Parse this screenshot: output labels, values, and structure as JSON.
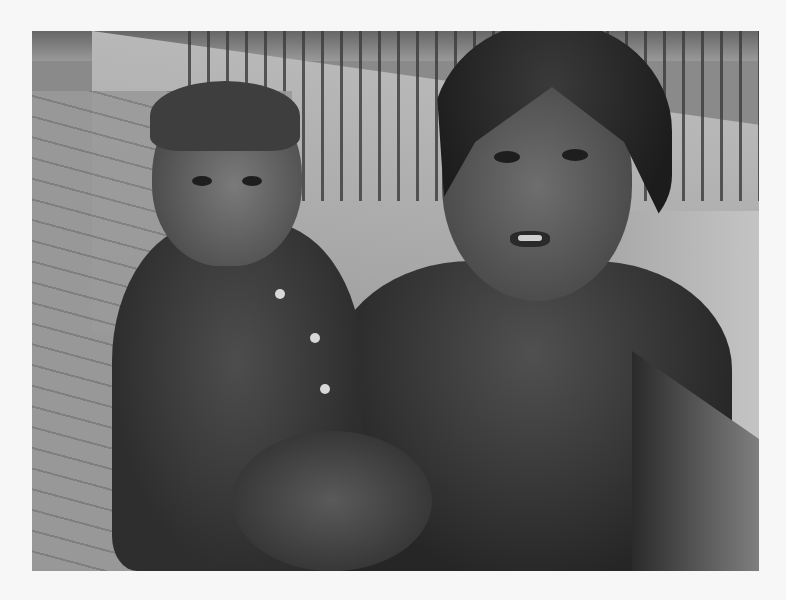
{
  "image": {
    "kind": "photograph",
    "color_mode": "grayscale",
    "frame": {
      "x": 32,
      "y": 31,
      "width": 727,
      "height": 540
    },
    "background_color": "#f7f7f7",
    "description": "Two children on a city pavement: an older girl wearing a dark knit cap and t-shirt holds a toddler in a button-up shirt; brick pavement, a low concrete wall and a metal railing fence in the background.",
    "subjects": [
      {
        "label": "toddler",
        "position": "left",
        "clothing": "dark button-up shirt with light buttons"
      },
      {
        "label": "girl",
        "position": "right",
        "clothing": "dark knit cap, dark t-shirt"
      }
    ],
    "scene_elements": [
      "brick pavement",
      "concrete wall",
      "metal fence railing",
      "debris in upper left"
    ]
  }
}
